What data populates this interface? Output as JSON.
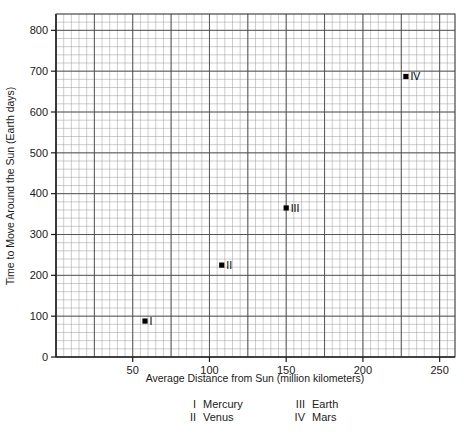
{
  "chart_data": {
    "type": "scatter",
    "title": "",
    "xlabel": "Average Distance from Sun (million kilometers)",
    "ylabel": "Time to Move Around the Sun (Earth days)",
    "xlim": [
      0,
      260
    ],
    "ylim": [
      0,
      840
    ],
    "xticks": [
      50,
      100,
      150,
      200,
      250
    ],
    "yticks": [
      0,
      100,
      200,
      300,
      400,
      500,
      600,
      700,
      800
    ],
    "xtick_labels": [
      "50",
      "100",
      "150",
      "200",
      "250"
    ],
    "ytick_labels": [
      "0",
      "100",
      "200",
      "300",
      "400",
      "500",
      "600",
      "700",
      "800"
    ],
    "grid": true,
    "grid_minor_x_step": 5,
    "grid_minor_y_step": 20,
    "grid_major_x_step": 25,
    "grid_major_y_step": 100,
    "legend_position": "below-axis",
    "points": [
      {
        "marker": "I",
        "name": "Mercury",
        "x": 58,
        "y": 88
      },
      {
        "marker": "II",
        "name": "Venus",
        "x": 108,
        "y": 225
      },
      {
        "marker": "III",
        "name": "Earth",
        "x": 150,
        "y": 365
      },
      {
        "marker": "IV",
        "name": "Mars",
        "x": 228,
        "y": 687
      }
    ],
    "series": [
      {
        "name": "Planets",
        "x": [
          58,
          108,
          150,
          228
        ],
        "values": [
          88,
          225,
          365,
          687
        ],
        "labels": [
          "I",
          "II",
          "III",
          "IV"
        ]
      }
    ],
    "colors": {
      "marker": "#000000",
      "axis": "#1a1a1a",
      "grid_major": "#4a4a4a",
      "grid_minor": "#9a9a9a",
      "background": "#ffffff"
    }
  },
  "legend": {
    "left_column": [
      {
        "numeral": "I",
        "label": "Mercury"
      },
      {
        "numeral": "II",
        "label": "Venus"
      }
    ],
    "right_column": [
      {
        "numeral": "III",
        "label": "Earth"
      },
      {
        "numeral": "IV",
        "label": "Mars"
      }
    ]
  }
}
